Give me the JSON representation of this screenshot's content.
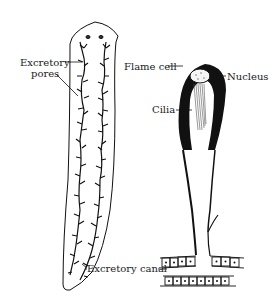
{
  "diagram": {
    "labels": {
      "excretory_pores_line1": "Excretory",
      "excretory_pores_line2": "pores",
      "flame_cell": "Flame cell",
      "nucleus": "Nucleus",
      "cilia": "Cilia",
      "excretory_canal": "Excretory canal"
    },
    "colors": {
      "ink": "#111111",
      "background": "#ffffff"
    }
  }
}
